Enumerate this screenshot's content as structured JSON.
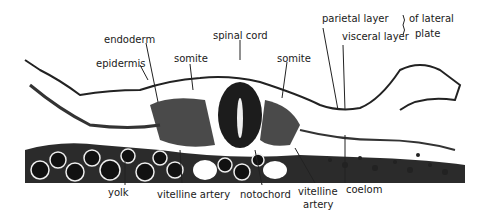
{
  "figure": {
    "labels": {
      "endoderm": "endoderm",
      "epidermis": "epidermis",
      "somite_left": "somite",
      "spinal_cord": "spinal cord",
      "somite_right": "somite",
      "parietal_layer": "parietal layer",
      "visceral_layer": "visceral layer",
      "of_lateral": "of lateral",
      "plate": "plate",
      "yolk": "yolk",
      "vitelline_artery_left": "vitelline artery",
      "notochord": "notochord",
      "vitelline_artery_right_1": "vitelline",
      "vitelline_artery_right_2": "artery",
      "coelom": "coelom"
    }
  }
}
